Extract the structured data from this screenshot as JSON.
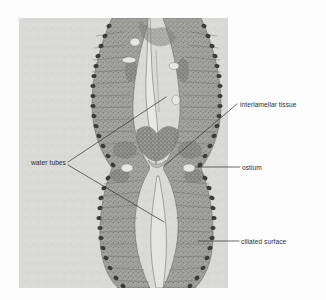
{
  "figure": {
    "type": "micrograph-diagram",
    "panel": {
      "background_color": "#d7d7d5",
      "page_background_color": "#fdfdfd",
      "x": 19,
      "y": 18,
      "width": 209,
      "height": 270
    },
    "tissue": {
      "fill_color": "#9a9a98",
      "cilia_color": "#3b3b3c",
      "lumen_color": "#e2e2e0"
    },
    "labels": [
      {
        "id": "water-tubes",
        "text": "water tubes",
        "anchor": "end",
        "text_x": 66,
        "text_y": 165,
        "leader": "M68,162 L166,97 M68,165 L164,222"
      },
      {
        "id": "interlamellar-tissue",
        "text": "interlamellar tissue",
        "anchor": "start",
        "text_x": 240,
        "text_y": 107,
        "leader": "M237,104 L164,166"
      },
      {
        "id": "ostium",
        "text": "ostium",
        "anchor": "start",
        "text_x": 242,
        "text_y": 170,
        "leader": "M196,167 L240,167"
      },
      {
        "id": "ciliated-surface",
        "text": "ciliated surface",
        "anchor": "start",
        "text_x": 241,
        "text_y": 244,
        "leader": "M198,241 L239,241"
      }
    ]
  }
}
